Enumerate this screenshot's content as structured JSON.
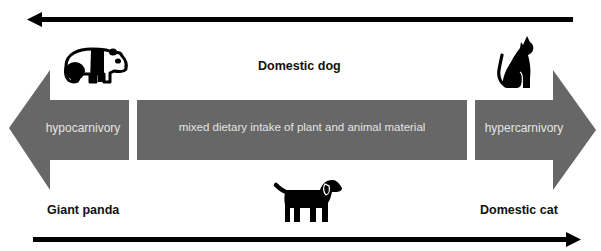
{
  "diagram": {
    "colors": {
      "arrow_fill": "#676767",
      "arrow_text": "#e4e4e4",
      "line": "#000000",
      "label_text": "#111111",
      "background": "#ffffff"
    },
    "spectrum": {
      "left_arrow_label": "hypocarnivory",
      "center_box_label": "mixed dietary intake of plant and animal material",
      "right_arrow_label": "hypercarnivory"
    },
    "animals": {
      "left": {
        "name": "Giant panda",
        "icon": "panda-icon"
      },
      "center": {
        "name": "Domestic dog",
        "icon": "dog-icon"
      },
      "right": {
        "name": "Domestic cat",
        "icon": "cat-icon"
      }
    },
    "top_arrow": {
      "direction": "left"
    },
    "bottom_arrow": {
      "direction": "right"
    }
  }
}
